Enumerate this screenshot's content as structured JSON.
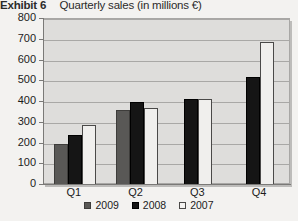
{
  "header": {
    "exhibit_label": "Exhibit 6",
    "title": "Quarterly sales (in millions €)"
  },
  "chart_data": {
    "type": "bar",
    "title": "Quarterly sales (in millions €)",
    "xlabel": "",
    "ylabel": "",
    "ylim": [
      0,
      800
    ],
    "ytick_step": 100,
    "yticks": [
      800,
      700,
      600,
      500,
      400,
      300,
      200,
      100,
      0
    ],
    "grid": true,
    "legend_position": "bottom",
    "categories": [
      "Q1",
      "Q2",
      "Q3",
      "Q4"
    ],
    "series": [
      {
        "name": "2009",
        "color": "#595856",
        "values": [
          200,
          360,
          null,
          null
        ]
      },
      {
        "name": "2008",
        "color": "#151515",
        "values": [
          240,
          400,
          415,
          520
        ]
      },
      {
        "name": "2007",
        "color": "#f0efed",
        "values": [
          290,
          370,
          415,
          690
        ]
      }
    ]
  }
}
